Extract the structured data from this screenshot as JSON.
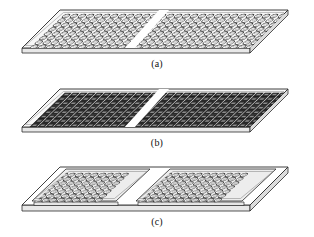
{
  "figure": {
    "name": "three-stage-board-assembly-figure",
    "background_color": "#ffffff",
    "line_color": "#2b2b2b",
    "panel_count": 3
  },
  "panels": [
    {
      "id": "a",
      "caption": "(a)",
      "description": "bare board with two arrays of open ring holes",
      "element_style": "ring",
      "element_fill": "#ffffff",
      "element_stroke": "#3a3a3a",
      "board_top_fill": "#f2f2f2",
      "board_edge_fill": "#e2e2e2",
      "rows": 8,
      "cols_left": 14,
      "cols_right": 14,
      "raised_subplates": false
    },
    {
      "id": "b",
      "caption": "(b)",
      "description": "board populated with dark filled components",
      "element_style": "filled-chip",
      "element_fill": "#2a2a2a",
      "element_stroke": "#1a1a1a",
      "board_top_fill": "#f2f2f2",
      "board_edge_fill": "#e2e2e2",
      "rows": 8,
      "cols_left": 14,
      "cols_right": 14,
      "raised_subplates": false
    },
    {
      "id": "c",
      "caption": "(c)",
      "description": "two raised sub-plates with ring arrays mounted on base board",
      "element_style": "ring",
      "element_fill": "#ffffff",
      "element_stroke": "#3a3a3a",
      "board_top_fill": "#ffffff",
      "board_edge_fill": "#e2e2e2",
      "subplate_fill": "#ececec",
      "rows": 7,
      "cols_left": 12,
      "cols_right": 12,
      "raised_subplates": true
    }
  ]
}
